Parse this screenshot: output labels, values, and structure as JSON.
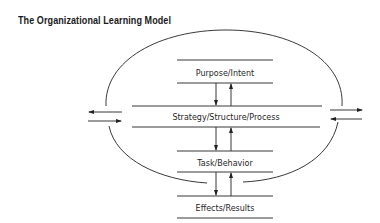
{
  "title": "The Organizational Learning Model",
  "levels": [
    {
      "label": "Purpose/Intent"
    },
    {
      "label": "Strategy/Structure/Process"
    },
    {
      "label": "Task/Behavior"
    },
    {
      "label": "Effects/Results"
    }
  ],
  "connectors": [
    {
      "from": "Purpose/Intent",
      "to": "Strategy/Structure/Process",
      "arrows": [
        "down",
        "up"
      ]
    },
    {
      "from": "Strategy/Structure/Process",
      "to": "Task/Behavior",
      "arrows": [
        "down",
        "up"
      ]
    },
    {
      "from": "Task/Behavior",
      "to": "Effects/Results",
      "arrows": [
        "down",
        "up"
      ]
    }
  ],
  "external_exchange": {
    "left": [
      "outward",
      "inward"
    ],
    "right": [
      "outward",
      "inward"
    ]
  },
  "colors": {
    "stroke": "#222222",
    "text": "#1f1f1f",
    "background": "#ffffff"
  }
}
